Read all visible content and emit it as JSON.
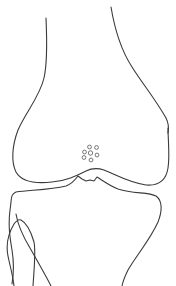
{
  "diagram": {
    "subject": "knee joint line drawing",
    "stroke_color": "#3a3a3a",
    "background_color": "#ffffff",
    "parts": [
      {
        "id": "femur",
        "label": "Femur (distal)"
      },
      {
        "id": "tibia",
        "label": "Tibia (proximal)"
      },
      {
        "id": "fibula",
        "label": "Fibula (proximal)"
      },
      {
        "id": "dot-cluster",
        "label": "Cluster of small circles",
        "count": 7
      }
    ]
  }
}
